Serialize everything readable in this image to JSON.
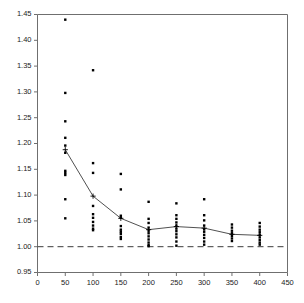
{
  "chart_data": {
    "type": "scatter",
    "title": "",
    "subtitle": "",
    "xlabel": "",
    "ylabel": "",
    "xlim": [
      0,
      450
    ],
    "ylim": [
      0.95,
      1.45
    ],
    "xticks": [
      0,
      50,
      100,
      150,
      200,
      250,
      300,
      350,
      400,
      450
    ],
    "xtick_labels": [
      "0",
      "50",
      "100",
      "150",
      "200",
      "250",
      "300",
      "350",
      "400",
      "450"
    ],
    "yticks": [
      0.95,
      1.0,
      1.05,
      1.1,
      1.15,
      1.2,
      1.25,
      1.3,
      1.35,
      1.4,
      1.45
    ],
    "ytick_labels": [
      "0.95",
      "1.00",
      "1.05",
      "1.10",
      "1.15",
      "1.20",
      "1.25",
      "1.30",
      "1.35",
      "1.40",
      "1.45"
    ],
    "grid": false,
    "legend": null,
    "reference_line": {
      "name": "baseline",
      "orientation": "horizontal",
      "y": 1.0,
      "style": "dashed",
      "color": "#3c3c3c"
    },
    "point_marker": "filled-square",
    "point_color": "#000000",
    "median_marker": "plus",
    "median_line_color": "#3c3c3c",
    "groups": [
      {
        "x": 50,
        "median": 1.188,
        "values": [
          1.44,
          1.298,
          1.243,
          1.211,
          1.196,
          1.182,
          1.147,
          1.143,
          1.139,
          1.092,
          1.055
        ]
      },
      {
        "x": 100,
        "median": 1.098,
        "values": [
          1.342,
          1.162,
          1.143,
          1.079,
          1.063,
          1.056,
          1.048,
          1.041,
          1.035,
          1.032
        ]
      },
      {
        "x": 150,
        "median": 1.055,
        "values": [
          1.141,
          1.111,
          1.06,
          1.056,
          1.04,
          1.033,
          1.029,
          1.025,
          1.019,
          1.015
        ]
      },
      {
        "x": 200,
        "median": 1.033,
        "values": [
          1.087,
          1.054,
          1.046,
          1.037,
          1.031,
          1.026,
          1.02,
          1.014,
          1.008,
          1.003,
          1.001
        ]
      },
      {
        "x": 250,
        "median": 1.039,
        "values": [
          1.084,
          1.061,
          1.054,
          1.047,
          1.041,
          1.035,
          1.03,
          1.024,
          1.018,
          1.01,
          1.002
        ]
      },
      {
        "x": 300,
        "median": 1.036,
        "values": [
          1.092,
          1.061,
          1.051,
          1.041,
          1.034,
          1.029,
          1.023,
          1.017,
          1.01,
          1.004
        ]
      },
      {
        "x": 350,
        "median": 1.024,
        "values": [
          1.043,
          1.037,
          1.031,
          1.026,
          1.021,
          1.016,
          1.011
        ]
      },
      {
        "x": 400,
        "median": 1.022,
        "values": [
          1.046,
          1.039,
          1.033,
          1.028,
          1.023,
          1.018,
          1.013,
          1.008,
          1.004
        ]
      }
    ],
    "median_series": {
      "name": "median-trend",
      "x": [
        50,
        100,
        150,
        200,
        250,
        300,
        350,
        400
      ],
      "values": [
        1.188,
        1.098,
        1.055,
        1.033,
        1.039,
        1.036,
        1.024,
        1.022
      ]
    }
  }
}
